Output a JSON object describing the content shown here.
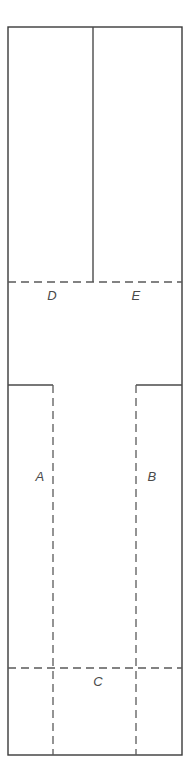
{
  "diagram": {
    "type": "floor-plan-partition",
    "canvas": {
      "width": 196,
      "height": 782
    },
    "colors": {
      "background": "#ffffff",
      "outline": "#3a3a3a",
      "divider": "#4a4a4a",
      "dashed": "#5a5a5a",
      "label": "#4a4a4a"
    },
    "outer_boundary": {
      "name": "outer-rectangle",
      "x": 8,
      "y": 27,
      "width": 174,
      "height": 728
    },
    "solid_lines": [
      {
        "name": "top-vertical-divider",
        "x1": 93,
        "y1": 27,
        "x2": 93,
        "y2": 282
      },
      {
        "name": "left-mid-horizontal-ledge",
        "x1": 8,
        "y1": 385,
        "x2": 53,
        "y2": 385
      },
      {
        "name": "right-mid-horizontal-ledge",
        "x1": 136,
        "y1": 385,
        "x2": 182,
        "y2": 385
      }
    ],
    "dashed_lines": [
      {
        "name": "upper-horizontal-dashed",
        "x1": 8,
        "y1": 282,
        "x2": 182,
        "y2": 282
      },
      {
        "name": "left-vertical-dashed",
        "x1": 53,
        "y1": 385,
        "x2": 53,
        "y2": 755
      },
      {
        "name": "right-vertical-dashed",
        "x1": 136,
        "y1": 385,
        "x2": 136,
        "y2": 755
      },
      {
        "name": "lower-horizontal-dashed",
        "x1": 8,
        "y1": 668,
        "x2": 182,
        "y2": 668
      }
    ],
    "dash_pattern": "8 5",
    "labels": [
      {
        "id": "A",
        "text": "A",
        "x": 40,
        "y": 478
      },
      {
        "id": "B",
        "text": "B",
        "x": 152,
        "y": 478
      },
      {
        "id": "C",
        "text": "C",
        "x": 98,
        "y": 683
      },
      {
        "id": "D",
        "text": "D",
        "x": 52,
        "y": 297
      },
      {
        "id": "E",
        "text": "E",
        "x": 136,
        "y": 297
      }
    ]
  }
}
